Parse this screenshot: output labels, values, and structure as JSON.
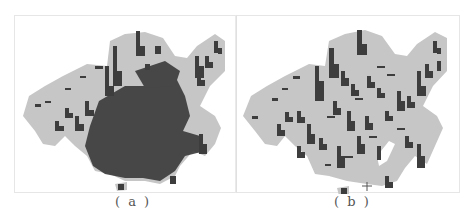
{
  "figure": {
    "panels": [
      {
        "id": "a",
        "caption": "( a )",
        "description": "Dense bar-symbol distribution over region map"
      },
      {
        "id": "b",
        "caption": "( b )",
        "description": "Sparser bar-symbol distribution over region map"
      }
    ],
    "colors": {
      "land": "#c6c6c6",
      "bar": "#3d3d3d",
      "border": "#e2e2e2",
      "background": "#ffffff"
    }
  }
}
